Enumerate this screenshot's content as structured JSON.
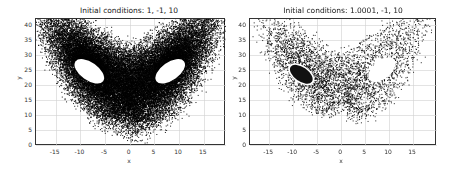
{
  "chart_data": [
    {
      "type": "scatter",
      "title": "Initial conditions: 1, -1, 10",
      "xlabel": "x",
      "ylabel": "y",
      "xlim": [
        -19,
        19.5
      ],
      "ylim": [
        -0.5,
        42
      ],
      "xticks": [
        -15,
        -10,
        -5,
        0,
        5,
        10,
        15
      ],
      "yticks": [
        0,
        5,
        10,
        15,
        20,
        25,
        30,
        35,
        40
      ],
      "grid": true,
      "marker_color": "#000000",
      "description": "Dense Lorenz butterfly attractor (x vs z) with two hollow ellipses centered near (-8, 24) and (8, 24)",
      "initial_conditions": [
        1,
        -1,
        10
      ],
      "series": [
        {
          "name": "trajectory",
          "density": "dense",
          "points": 40000
        }
      ]
    },
    {
      "type": "scatter",
      "title": "Initial conditions: 1.0001, -1, 10",
      "xlabel": "x",
      "ylabel": "y",
      "xlim": [
        -19,
        20
      ],
      "ylim": [
        -0.5,
        42
      ],
      "xticks": [
        -15,
        -10,
        -5,
        0,
        5,
        10,
        15
      ],
      "yticks": [
        0,
        5,
        10,
        15,
        20,
        25,
        30,
        35,
        40
      ],
      "grid": true,
      "marker_color": "#000000",
      "description": "Sparser Lorenz attractor; left lobe contains a dense filled ellipse near (-8, 24), right lobe hollow near (8, 25)",
      "initial_conditions": [
        1.0001,
        -1,
        10
      ],
      "series": [
        {
          "name": "trajectory",
          "density": "sparse",
          "points": 4000
        }
      ]
    }
  ],
  "plots": [
    {
      "title": "Initial conditions: 1, -1, 10",
      "xlabel": "x",
      "ylabel": "y",
      "xticks": [
        "-15",
        "-10",
        "-5",
        "0",
        "5",
        "10",
        "15"
      ],
      "yticks": [
        "0",
        "5",
        "10",
        "15",
        "20",
        "25",
        "30",
        "35",
        "40"
      ]
    },
    {
      "title": "Initial conditions: 1.0001, -1, 10",
      "xlabel": "x",
      "ylabel": "y",
      "xticks": [
        "-15",
        "-10",
        "-5",
        "0",
        "5",
        "10",
        "15"
      ],
      "yticks": [
        "0",
        "5",
        "10",
        "15",
        "20",
        "25",
        "30",
        "35",
        "40"
      ]
    }
  ]
}
